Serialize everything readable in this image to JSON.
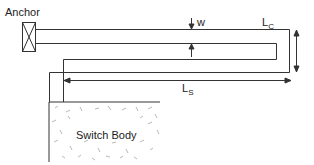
{
  "diagram": {
    "labels": {
      "anchor": "Anchor",
      "w": "w",
      "lc_main": "L",
      "lc_sub": "C",
      "ls_main": "L",
      "ls_sub": "S",
      "switch_body": "Switch Body"
    },
    "colors": {
      "line": "#333333",
      "hatch": "#9a9a9a"
    }
  }
}
